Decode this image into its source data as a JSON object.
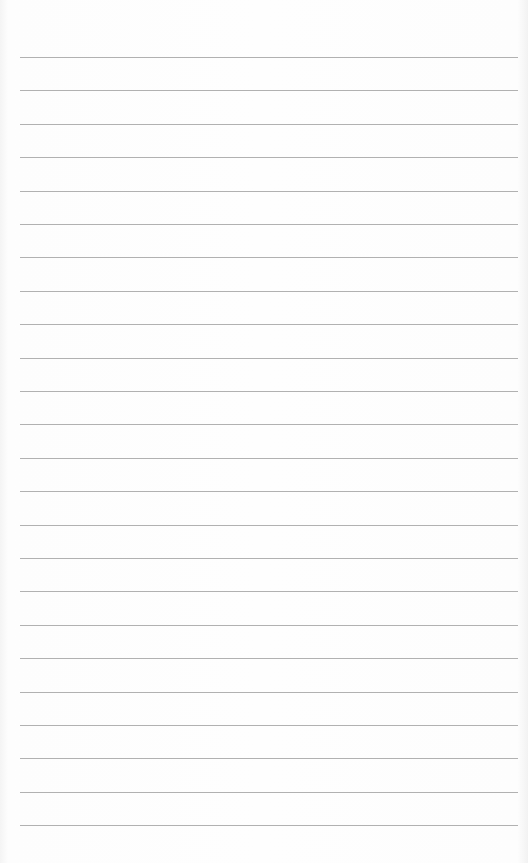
{
  "page": {
    "type": "lined-paper",
    "background_color": "#fdfdfd",
    "line_color": "#a3a3a3",
    "line_count": 24,
    "first_line_y": 57,
    "line_spacing": 33.4,
    "line_left": 20,
    "line_right": 518
  }
}
